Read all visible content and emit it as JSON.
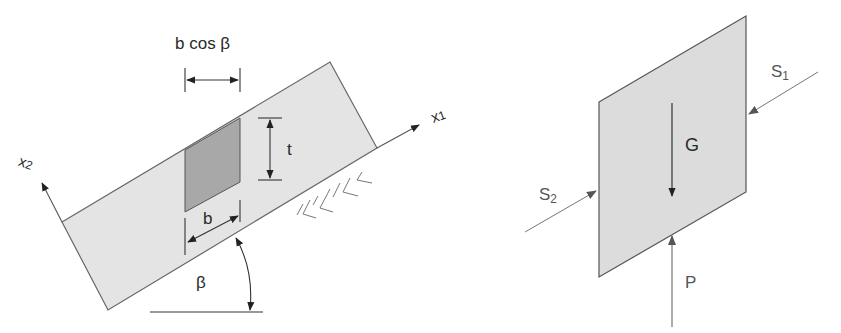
{
  "colors": {
    "slab_fill": "#e4e4e4",
    "element_fill": "#a8a8a8",
    "stroke": "#555555",
    "text": "#2a2a2a",
    "free_body_fill": "#dcdcdc"
  },
  "left_figure": {
    "labels": {
      "b_cos_beta": "b cos β",
      "t": "t",
      "b": "b",
      "beta": "β",
      "x1_main": "x",
      "x1_sub": "1",
      "x2_main": "x",
      "x2_sub": "2"
    }
  },
  "right_figure": {
    "labels": {
      "G": "G",
      "P": "P",
      "S1_main": "S",
      "S1_sub": "1",
      "S2_main": "S",
      "S2_sub": "2"
    }
  }
}
